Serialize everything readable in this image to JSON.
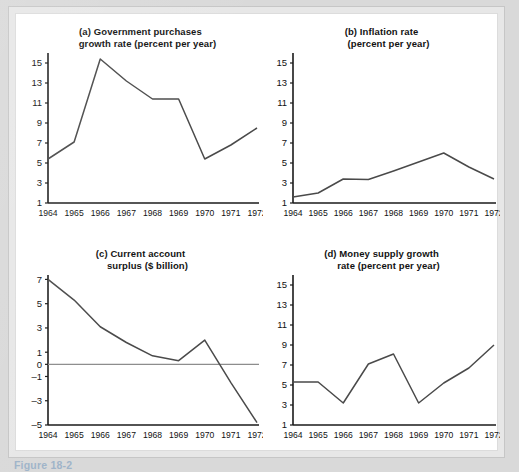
{
  "figure": {
    "caption": "Figure 18-2",
    "axis_color": "#1a1a1a",
    "line_color": "#4a4a4a",
    "background": "#ffffff"
  },
  "chart_data": [
    {
      "type": "line",
      "panel": "a",
      "title_line1": "(a) Government purchases",
      "title_line2": "growth rate (percent per year)",
      "xlabel": "",
      "ylabel": "",
      "x": [
        "1964",
        "1965",
        "1966",
        "1967",
        "1968",
        "1969",
        "1970",
        "1971",
        "1972"
      ],
      "values": [
        5.4,
        7.1,
        15.4,
        13.2,
        11.4,
        11.4,
        5.4,
        6.8,
        8.5
      ],
      "yticks": [
        1,
        3,
        5,
        7,
        9,
        11,
        13,
        15
      ],
      "ylim": [
        1,
        15.8
      ],
      "grid": false,
      "legend": "none"
    },
    {
      "type": "line",
      "panel": "b",
      "title_line1": "(b) Inflation rate",
      "title_line2": "(percent per year)",
      "xlabel": "",
      "ylabel": "",
      "x": [
        "1964",
        "1965",
        "1966",
        "1967",
        "1968",
        "1969",
        "1970",
        "1971",
        "1972"
      ],
      "values": [
        1.6,
        2.0,
        3.4,
        3.35,
        4.2,
        5.1,
        6.0,
        4.6,
        3.4
      ],
      "yticks": [
        1,
        3,
        5,
        7,
        9,
        11,
        13,
        15
      ],
      "ylim": [
        1,
        15.8
      ],
      "grid": false,
      "legend": "none"
    },
    {
      "type": "line",
      "panel": "c",
      "title_line1": "(c) Current account",
      "title_line2": "surplus ($ billion)",
      "xlabel": "",
      "ylabel": "",
      "x": [
        "1964",
        "1965",
        "1966",
        "1967",
        "1968",
        "1969",
        "1970",
        "1971",
        "1972"
      ],
      "values": [
        7.0,
        5.3,
        3.1,
        1.8,
        0.7,
        0.3,
        2.0,
        -1.5,
        -4.8
      ],
      "yticks": [
        -5,
        -3,
        -1,
        0,
        1,
        3,
        5,
        7
      ],
      "ylim": [
        -5,
        7.2
      ],
      "zero_line": 0,
      "grid": false,
      "legend": "none"
    },
    {
      "type": "line",
      "panel": "d",
      "title_line1": "(d) Money supply growth",
      "title_line2": "rate (percent per year)",
      "xlabel": "",
      "ylabel": "",
      "x": [
        "1964",
        "1965",
        "1966",
        "1967",
        "1968",
        "1969",
        "1970",
        "1971",
        "1972"
      ],
      "values": [
        5.3,
        5.3,
        3.2,
        7.1,
        8.1,
        3.2,
        5.2,
        6.7,
        9.0
      ],
      "yticks": [
        1,
        3,
        5,
        7,
        9,
        11,
        13,
        15
      ],
      "ylim": [
        1,
        15.8
      ],
      "grid": false,
      "legend": "none"
    }
  ]
}
